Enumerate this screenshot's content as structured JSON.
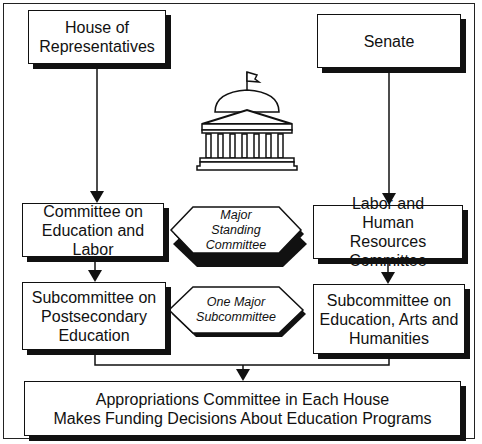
{
  "diagram": {
    "type": "flowchart",
    "nodes": {
      "house": {
        "label": "House of Representatives"
      },
      "senate": {
        "label": "Senate"
      },
      "house_committee": {
        "label": "Committee on Education and Labor"
      },
      "senate_committee": {
        "label": "Labor and Human Resources Committee"
      },
      "standing_label": {
        "label": "Major Standing Committee"
      },
      "house_subcommittee": {
        "label": "Subcommittee on Postsecondary Education"
      },
      "senate_subcommittee": {
        "label": "Subcommittee on Education, Arts and Humanities"
      },
      "subcommittee_label": {
        "label": "One Major Subcommittee"
      },
      "appropriations": {
        "line1": "Appropriations Committee in Each House",
        "line2": "Makes Funding Decisions About Education Programs"
      }
    },
    "edges": [
      {
        "from": "house",
        "to": "house_committee"
      },
      {
        "from": "senate",
        "to": "senate_committee"
      },
      {
        "from": "house_committee",
        "to": "house_subcommittee"
      },
      {
        "from": "senate_committee",
        "to": "senate_subcommittee"
      },
      {
        "from": "house_subcommittee",
        "to": "appropriations"
      },
      {
        "from": "senate_subcommittee",
        "to": "appropriations"
      }
    ],
    "icons": {
      "center": "capitol-building-icon"
    }
  }
}
